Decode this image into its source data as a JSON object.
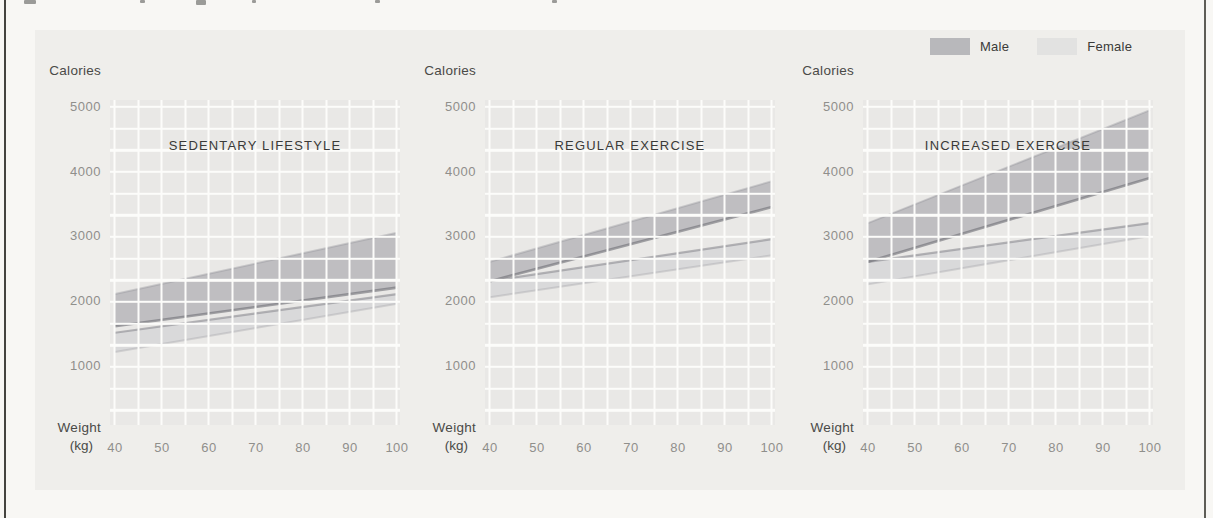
{
  "page": {
    "colors": {
      "page_bg": "#f8f7f4",
      "card_bg": "#efeeeb",
      "grid_cell": "#e9e8e6",
      "grid_line": "#fcfcfa",
      "male_band": "#a5a5aa",
      "female_band": "#c8c8cc",
      "male_edge": "#6d6d74",
      "female_edge": "#84848b"
    }
  },
  "legend": {
    "position": "top-right",
    "items": [
      {
        "label": "Male",
        "color": "#b8b8bb"
      },
      {
        "label": "Female",
        "color": "#e2e2e1"
      }
    ]
  },
  "axes": {
    "y_axis_label": "Calories",
    "x_axis_label_line1": "Weight",
    "x_axis_label_line2": "(kg)",
    "y_ticks": [
      "5000",
      "4000",
      "3000",
      "2000",
      "1000"
    ],
    "x_ticks": [
      "40",
      "50",
      "60",
      "70",
      "80",
      "90",
      "100"
    ]
  },
  "chart_data": [
    {
      "type": "area",
      "title": "SEDENTARY LIFESTYLE",
      "xlabel": "Weight (kg)",
      "ylabel": "Calories",
      "x": [
        40,
        100
      ],
      "xlim": [
        40,
        100
      ],
      "ylim": [
        0,
        5000
      ],
      "grid": true,
      "series": [
        {
          "name": "Male",
          "lower": [
            1600,
            2200
          ],
          "upper": [
            2100,
            3050
          ]
        },
        {
          "name": "Female",
          "lower": [
            1200,
            1950
          ],
          "upper": [
            1500,
            2100
          ]
        }
      ]
    },
    {
      "type": "area",
      "title": "REGULAR EXERCISE",
      "xlabel": "Weight (kg)",
      "ylabel": "Calories",
      "x": [
        40,
        100
      ],
      "xlim": [
        40,
        100
      ],
      "ylim": [
        0,
        5000
      ],
      "grid": true,
      "series": [
        {
          "name": "Male",
          "lower": [
            2300,
            3450
          ],
          "upper": [
            2600,
            3850
          ]
        },
        {
          "name": "Female",
          "lower": [
            2050,
            2700
          ],
          "upper": [
            2300,
            2950
          ]
        }
      ]
    },
    {
      "type": "area",
      "title": "INCREASED EXERCISE",
      "xlabel": "Weight (kg)",
      "ylabel": "Calories",
      "x": [
        40,
        100
      ],
      "xlim": [
        40,
        100
      ],
      "ylim": [
        0,
        5000
      ],
      "grid": true,
      "series": [
        {
          "name": "Male",
          "lower": [
            2600,
            3900
          ],
          "upper": [
            3200,
            4950
          ]
        },
        {
          "name": "Female",
          "lower": [
            2250,
            3000
          ],
          "upper": [
            2600,
            3200
          ]
        }
      ]
    }
  ]
}
